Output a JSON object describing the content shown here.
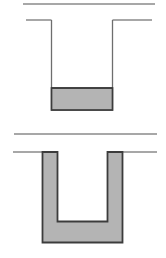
{
  "document": {
    "kind": "engineering-cross-section-diagram",
    "figure_count": 2,
    "width_px": 166,
    "height_px": 258,
    "background_color": "#ffffff"
  },
  "palette": {
    "background": "#ffffff",
    "fill_gray": "#b4b4b4",
    "fill_gray_light": "#bdbdbd",
    "outline_dark": "#3c3c3c",
    "outline_mid": "#6e6e6e",
    "ground_line": "#8a8a8a"
  },
  "figures": [
    {
      "id": "figure-top",
      "name": "trench-with-liquid-fill",
      "description": "Open trench cross-section with thin outline walls and a gray liquid layer resting at the bottom of the trench.",
      "ground_surface_line": {
        "name": "upper-ground-line",
        "x1": 23,
        "y1": 4,
        "x2": 155,
        "y2": 4,
        "color": "#8a8a8a",
        "thickness": 1.6
      },
      "grade_line_left": {
        "name": "grade-line-left",
        "x1": 26,
        "y1": 20,
        "x2": 51,
        "y2": 20,
        "color": "#8a8a8a",
        "thickness": 1.4
      },
      "grade_line_right": {
        "name": "grade-line-right",
        "x1": 113,
        "y1": 20,
        "x2": 152,
        "y2": 20,
        "color": "#8a8a8a",
        "thickness": 1.4
      },
      "trench_outline": {
        "name": "trench-wall-outline",
        "left_wall_x": 51,
        "right_wall_x": 113,
        "top_y": 20,
        "bottom_y": 110,
        "color": "#6e6e6e",
        "thickness": 1.3
      },
      "liquid_fill": {
        "name": "liquid-fill-block",
        "x": 51,
        "y": 88,
        "width": 62,
        "height": 22,
        "fill": "#b4b4b4",
        "stroke": "#3c3c3c",
        "stroke_width": 1.6,
        "surface_y": 88,
        "depth_px": 22
      }
    },
    {
      "id": "figure-bottom",
      "name": "u-shaped-channel-lining",
      "description": "Same trench geometry rendered as a solid gray U-shaped lining of uniform wall thickness, open at the top.",
      "ground_surface_line": {
        "name": "upper-ground-line",
        "x1": 14,
        "y1": 5,
        "x2": 157,
        "y2": 5,
        "color": "#8a8a8a",
        "thickness": 1.6
      },
      "grade_line_left": {
        "name": "grade-line-left",
        "x1": 13,
        "y1": 23,
        "x2": 44,
        "y2": 23,
        "color": "#8a8a8a",
        "thickness": 1.4
      },
      "grade_line_right": {
        "name": "grade-line-right",
        "x1": 110,
        "y1": 23,
        "x2": 157,
        "y2": 23,
        "color": "#8a8a8a",
        "thickness": 1.4
      },
      "u_lining": {
        "name": "u-lining-body",
        "outer_left_x": 42,
        "outer_right_x": 123,
        "outer_top_y": 23,
        "outer_bottom_y": 114,
        "inner_left_x": 57,
        "inner_right_x": 108,
        "inner_bottom_y": 93,
        "wall_thickness_px": 15,
        "base_thickness_px": 21,
        "fill": "#b4b4b4",
        "stroke": "#3c3c3c",
        "stroke_width": 1.8
      }
    }
  ]
}
